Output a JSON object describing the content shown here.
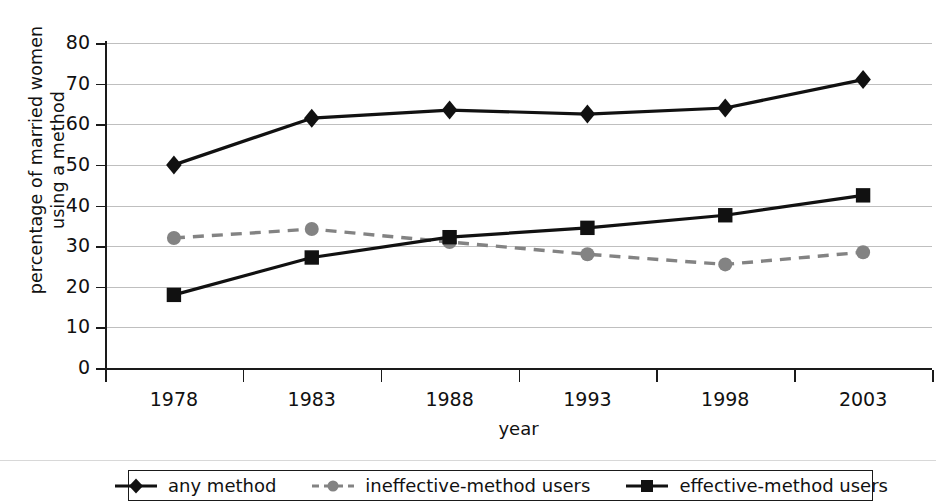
{
  "chart_data": {
    "type": "line",
    "title": "",
    "xlabel": "year",
    "ylabel": "percentage of married women using a method",
    "ylabel_line1": "percentage of married women",
    "ylabel_line2": "using a method",
    "categories": [
      "1978",
      "1983",
      "1988",
      "1993",
      "1998",
      "2003"
    ],
    "x_tick_labels": [
      "1978",
      "1983",
      "1988",
      "1993",
      "1998",
      "2003"
    ],
    "y_tick_labels": [
      "80",
      "70",
      "60",
      "50",
      "40",
      "30",
      "20",
      "10",
      "0"
    ],
    "ylim": [
      0,
      80
    ],
    "y_step": 10,
    "grid": true,
    "legend_position": "bottom",
    "series": [
      {
        "name": "any method",
        "marker": "diamond",
        "line_style": "solid",
        "color": "#111111",
        "values": [
          50.0,
          61.5,
          63.5,
          62.5,
          64.0,
          71.0
        ]
      },
      {
        "name": "ineffective-method users",
        "marker": "circle",
        "line_style": "dashed",
        "color": "#838383",
        "values": [
          32.0,
          34.2,
          31.0,
          28.0,
          25.5,
          28.5
        ]
      },
      {
        "name": "effective-method users",
        "marker": "square",
        "line_style": "solid",
        "color": "#111111",
        "values": [
          18.0,
          27.2,
          32.2,
          34.5,
          37.6,
          42.5
        ]
      }
    ]
  },
  "legend": {
    "entries": [
      {
        "label": "any method"
      },
      {
        "label": "ineffective-method users"
      },
      {
        "label": "effective-method users"
      }
    ]
  },
  "colors": {
    "series_dark": "#111111",
    "series_gray": "#838383",
    "grid": "#bfbfbf",
    "axis": "#1a1a1a",
    "background": "#ffffff"
  }
}
